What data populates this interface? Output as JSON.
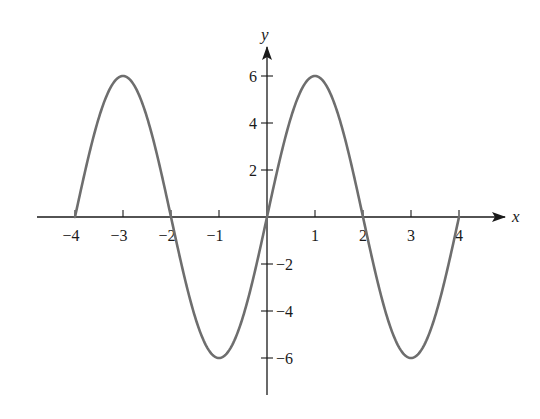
{
  "chart_data": {
    "type": "line",
    "title": "",
    "xlabel": "x",
    "ylabel": "y",
    "xlim": [
      -4,
      4
    ],
    "ylim": [
      -6,
      6
    ],
    "grid": false,
    "legend": null,
    "x_ticks": [
      -4,
      -3,
      -2,
      -1,
      1,
      2,
      3,
      4
    ],
    "x_tick_labels": [
      "−4",
      "−3",
      "−2",
      "−1",
      "1",
      "2",
      "3",
      "4"
    ],
    "y_ticks": [
      6,
      4,
      2,
      -2,
      -4,
      -6
    ],
    "y_tick_labels": [
      "6",
      "4",
      "2",
      "−2",
      "−4",
      "−6"
    ],
    "series": [
      {
        "name": "y = 6 sin(πx/2)",
        "color": "#6e6e6e",
        "x": [
          -4,
          -3.5,
          -3,
          -2.5,
          -2,
          -1.5,
          -1,
          -0.5,
          0,
          0.5,
          1,
          1.5,
          2,
          2.5,
          3,
          3.5,
          4
        ],
        "y": [
          0,
          4.24,
          6,
          4.24,
          0,
          -4.24,
          -6,
          -4.24,
          0,
          4.24,
          6,
          4.24,
          0,
          -4.24,
          -6,
          -4.24,
          0
        ]
      }
    ],
    "key_points": {
      "maxima": [
        [
          -3,
          6
        ],
        [
          1,
          6
        ]
      ],
      "minima": [
        [
          -1,
          -6
        ],
        [
          3,
          -6
        ]
      ],
      "zeros": [
        -4,
        -2,
        0,
        2,
        4
      ]
    }
  },
  "style": {
    "axis_color": "#1a1a1a",
    "curve_color": "#6e6e6e"
  }
}
